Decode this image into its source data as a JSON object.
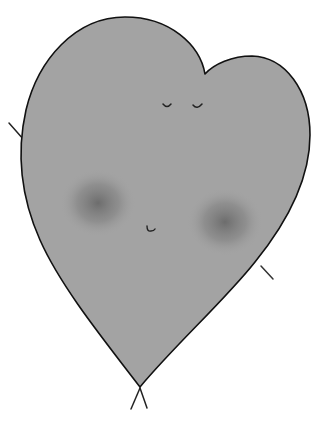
{
  "illustration": {
    "subject": "heart character",
    "description": "Hand-drawn gray heart with closed eyes, soft dark blush cheeks, tiny mouth, small stick arms and legs",
    "colors": {
      "background": "#ffffff",
      "body_fill": "#a3a3a3",
      "outline": "#111111",
      "blush": "#6e6e6e"
    }
  }
}
